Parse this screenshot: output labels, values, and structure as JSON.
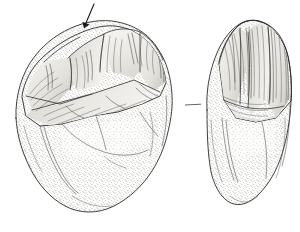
{
  "figure": {
    "domain": "scientific-illustration",
    "caption": "",
    "background_color": "#ffffff",
    "ink_color": "#2b2b2b",
    "canvas": {
      "width": 300,
      "height": 232
    },
    "technique": "stipple and line drawing",
    "views": [
      {
        "id": "left-view",
        "label": "",
        "position": "left",
        "description": "Dorsal / flaked-face view of cobble core showing multiple overlapping flake scars along the upper margin and stippled cortex over the lower two-thirds.",
        "bounds": {
          "x": 14,
          "y": 18,
          "width": 170,
          "height": 196
        },
        "surfaces": [
          {
            "name": "flake-scar-field",
            "shading": "line-hatched",
            "fill": "#efeeea"
          },
          {
            "name": "cortex-body",
            "shading": "stippled",
            "fill": "#e9e8e3"
          }
        ]
      },
      {
        "id": "right-view",
        "label": "",
        "position": "right",
        "description": "Lateral / edge view of the same artifact, narrower profile, with a column of flake scars along the right margin and stippled cortex on the left and lower body.",
        "bounds": {
          "x": 203,
          "y": 20,
          "width": 92,
          "height": 190
        },
        "surfaces": [
          {
            "name": "flake-scar-field",
            "shading": "line-hatched",
            "fill": "#eceae6"
          },
          {
            "name": "cortex-body",
            "shading": "stippled",
            "fill": "#e9e8e3"
          }
        ]
      }
    ],
    "annotations": [
      {
        "id": "feature-arrow",
        "type": "arrow",
        "points_to": "retouched notch on upper working edge of left view",
        "label": "",
        "color": "#1a1a1a",
        "from": {
          "x": 94,
          "y": 4
        },
        "to": {
          "x": 84,
          "y": 28
        }
      },
      {
        "id": "view-connector",
        "type": "tick-line",
        "label": "",
        "color": "#3a3a3a",
        "from": {
          "x": 185,
          "y": 105
        },
        "to": {
          "x": 201,
          "y": 104
        }
      }
    ]
  }
}
